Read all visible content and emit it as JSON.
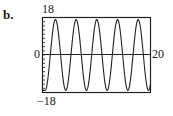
{
  "part_label": "b.",
  "chart_data": {
    "type": "line",
    "title": "",
    "xlabel": "",
    "ylabel": "",
    "xlim": [
      0,
      20
    ],
    "ylim": [
      -18,
      18
    ],
    "grid": false,
    "legend": null,
    "tick_labels": {
      "ymax": "18",
      "ymin": "−18",
      "origin": "0",
      "xmax": "20"
    },
    "series": [
      {
        "name": "oscillation",
        "description": "sinusoidal oscillation, amplitude ≈ 17, period ≈ 3.8, starting near −18 at x=0; 5 peaks visible",
        "amplitude": 17,
        "period": 3.83,
        "peak_x": [
          2.4,
          6.3,
          10.1,
          13.9,
          17.8
        ],
        "trough_x": [
          0.0,
          4.3,
          8.2,
          12.0,
          15.9,
          19.7
        ]
      }
    ]
  },
  "colors": {
    "curve": "#222222",
    "axis": "#222222",
    "frame": "#222222"
  }
}
